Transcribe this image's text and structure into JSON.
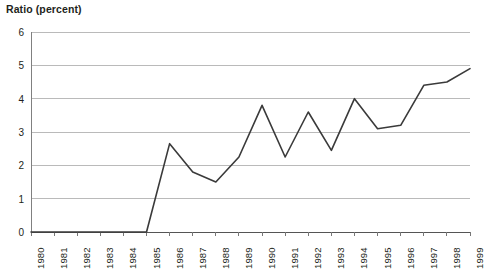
{
  "chart_data": {
    "type": "line",
    "title": "Ratio (percent)",
    "xlabel": "",
    "ylabel": "Ratio (percent)",
    "ylim": [
      0,
      6
    ],
    "yticks": [
      0,
      1,
      2,
      3,
      4,
      5,
      6
    ],
    "ytick_labels": [
      "0",
      "1",
      "2",
      "3",
      "4",
      "5",
      "6"
    ],
    "grid": true,
    "grid_axis": "y",
    "legend": false,
    "legend_position": "none",
    "line_color": "#3a3a3a",
    "grid_color": "#b3b3b3",
    "axis_color": "#808080",
    "categories": [
      "1980",
      "1981",
      "1982",
      "1983",
      "1984",
      "1985",
      "1986",
      "1987",
      "1988",
      "1989",
      "1990",
      "1991",
      "1992",
      "1993",
      "1994",
      "1995",
      "1996",
      "1997",
      "1998",
      "1999"
    ],
    "values": [
      0,
      0,
      0,
      0,
      0,
      0,
      2.65,
      1.8,
      1.5,
      2.25,
      3.8,
      2.25,
      3.6,
      2.45,
      4.0,
      3.1,
      3.2,
      4.4,
      4.5,
      4.9
    ],
    "x": [
      1980,
      1981,
      1982,
      1983,
      1984,
      1985,
      1986,
      1987,
      1988,
      1989,
      1990,
      1991,
      1992,
      1993,
      1994,
      1995,
      1996,
      1997,
      1998,
      1999
    ]
  }
}
